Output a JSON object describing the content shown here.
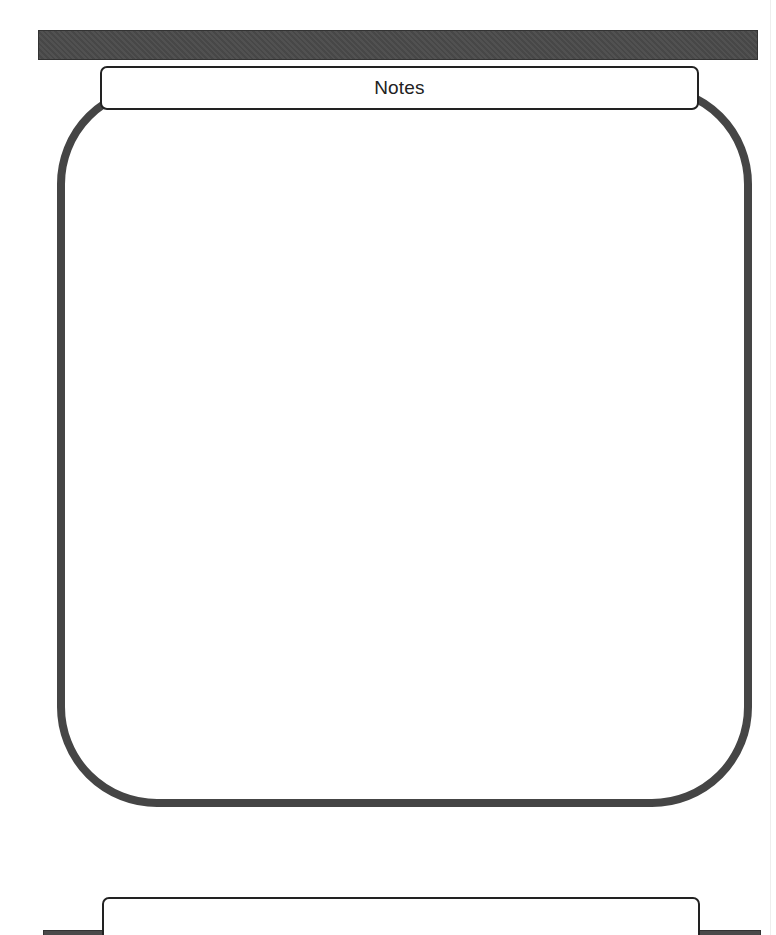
{
  "page": {
    "top_section": {
      "header_bar_color": "#4a4a4a",
      "title": "Notes",
      "frame_color": "#454545",
      "notes_content": ""
    },
    "bottom_section": {
      "header_bar_color": "#4a4a4a",
      "title": ""
    }
  }
}
